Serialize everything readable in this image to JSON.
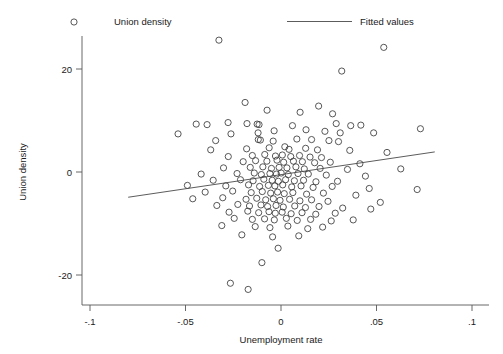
{
  "chart_data": {
    "type": "scatter",
    "title": "",
    "xlabel": "Unemployment rate",
    "ylabel": "Union density",
    "xlim": [
      -0.1,
      0.1
    ],
    "ylim": [
      -26,
      27
    ],
    "xticks": [
      -0.1,
      -0.05,
      0,
      0.05,
      0.1
    ],
    "xticklabels": [
      "-.1",
      "-.05",
      "0",
      ".05",
      ".1"
    ],
    "yticks": [
      20,
      0,
      -20
    ],
    "yticklabels": [
      "20",
      "0",
      "-20"
    ],
    "grid": false,
    "legend_position": "top",
    "legend": [
      {
        "label": "Union density",
        "marker": "open-circle"
      },
      {
        "label": "Fitted values",
        "marker": "line"
      }
    ],
    "series": [
      {
        "name": "Union density",
        "marker": "open-circle",
        "marker_color": "#3a3a3a",
        "points": [
          [
            -0.0325,
            25.6
          ],
          [
            0.0538,
            24.2
          ],
          [
            0.0318,
            19.6
          ],
          [
            -0.0188,
            13.5
          ],
          [
            -0.0073,
            12.0
          ],
          [
            0.01,
            11.6
          ],
          [
            0.0197,
            12.8
          ],
          [
            0.027,
            11.3
          ],
          [
            -0.0444,
            9.3
          ],
          [
            -0.0387,
            9.2
          ],
          [
            -0.0277,
            9.6
          ],
          [
            -0.0178,
            9.4
          ],
          [
            -0.0125,
            9.3
          ],
          [
            -0.0115,
            9.2
          ],
          [
            0.006,
            9.0
          ],
          [
            0.0289,
            9.4
          ],
          [
            0.0365,
            9.0
          ],
          [
            0.0418,
            9.1
          ],
          [
            -0.0539,
            7.4
          ],
          [
            -0.0262,
            7.4
          ],
          [
            -0.012,
            7.6
          ],
          [
            -0.0036,
            8.0
          ],
          [
            0.0131,
            8.2
          ],
          [
            0.023,
            7.9
          ],
          [
            0.031,
            7.6
          ],
          [
            0.0485,
            7.6
          ],
          [
            0.073,
            8.4
          ],
          [
            -0.0342,
            6.1
          ],
          [
            -0.0119,
            6.3
          ],
          [
            -0.0108,
            6.2
          ],
          [
            -0.0041,
            6.0
          ],
          [
            0.0083,
            6.4
          ],
          [
            0.016,
            6.3
          ],
          [
            0.0251,
            6.1
          ],
          [
            0.0301,
            5.9
          ],
          [
            -0.0368,
            4.3
          ],
          [
            -0.018,
            4.5
          ],
          [
            -0.0062,
            4.7
          ],
          [
            0.002,
            4.9
          ],
          [
            0.0042,
            4.4
          ],
          [
            0.0129,
            4.6
          ],
          [
            0.0191,
            4.3
          ],
          [
            0.036,
            4.2
          ],
          [
            0.0555,
            3.8
          ],
          [
            -0.0276,
            3.0
          ],
          [
            -0.015,
            3.2
          ],
          [
            -0.0085,
            3.4
          ],
          [
            -0.0029,
            3.1
          ],
          [
            0.0007,
            3.3
          ],
          [
            0.0051,
            3.0
          ],
          [
            0.0097,
            3.2
          ],
          [
            0.0152,
            2.9
          ],
          [
            0.0212,
            2.8
          ],
          [
            -0.0198,
            2.0
          ],
          [
            -0.0133,
            2.2
          ],
          [
            -0.0074,
            2.1
          ],
          [
            -0.0021,
            2.3
          ],
          [
            0.0014,
            1.9
          ],
          [
            0.0065,
            2.1
          ],
          [
            0.0112,
            2.0
          ],
          [
            0.0176,
            1.8
          ],
          [
            0.0258,
            1.9
          ],
          [
            0.0413,
            1.6
          ],
          [
            -0.0301,
            0.8
          ],
          [
            -0.0161,
            0.9
          ],
          [
            -0.0095,
            1.0
          ],
          [
            -0.005,
            0.7
          ],
          [
            -0.001,
            0.9
          ],
          [
            0.0031,
            0.8
          ],
          [
            0.0078,
            1.0
          ],
          [
            0.0122,
            0.6
          ],
          [
            0.0205,
            0.7
          ],
          [
            0.0348,
            0.5
          ],
          [
            0.0627,
            0.6
          ],
          [
            -0.0418,
            -0.4
          ],
          [
            -0.023,
            -0.3
          ],
          [
            -0.014,
            -0.2
          ],
          [
            -0.0103,
            -0.5
          ],
          [
            -0.0058,
            -0.3
          ],
          [
            -0.0024,
            -0.4
          ],
          [
            0.0001,
            -0.2
          ],
          [
            0.0038,
            -0.5
          ],
          [
            0.0089,
            -0.3
          ],
          [
            0.0143,
            -0.4
          ],
          [
            0.0237,
            -0.6
          ],
          [
            0.0442,
            -0.8
          ],
          [
            -0.0355,
            -1.6
          ],
          [
            -0.0212,
            -1.5
          ],
          [
            -0.0146,
            -1.7
          ],
          [
            -0.009,
            -1.4
          ],
          [
            -0.0046,
            -1.6
          ],
          [
            -0.0014,
            -1.8
          ],
          [
            0.0024,
            -1.5
          ],
          [
            0.007,
            -1.7
          ],
          [
            0.0118,
            -1.6
          ],
          [
            0.0183,
            -1.9
          ],
          [
            0.0296,
            -1.8
          ],
          [
            -0.049,
            -2.6
          ],
          [
            -0.0289,
            -2.7
          ],
          [
            -0.017,
            -2.5
          ],
          [
            -0.0112,
            -2.8
          ],
          [
            -0.0066,
            -2.6
          ],
          [
            -0.0032,
            -2.7
          ],
          [
            0.0009,
            -2.5
          ],
          [
            0.0056,
            -2.9
          ],
          [
            0.0105,
            -2.7
          ],
          [
            0.0168,
            -3.0
          ],
          [
            0.0268,
            -2.8
          ],
          [
            0.0462,
            -3.2
          ],
          [
            0.0713,
            -3.4
          ],
          [
            -0.0397,
            -3.9
          ],
          [
            -0.0253,
            -3.7
          ],
          [
            -0.0156,
            -4.0
          ],
          [
            -0.0098,
            -3.8
          ],
          [
            -0.0054,
            -4.1
          ],
          [
            -0.0018,
            -3.9
          ],
          [
            0.0017,
            -4.2
          ],
          [
            0.0062,
            -4.0
          ],
          [
            0.0134,
            -4.3
          ],
          [
            0.0222,
            -4.1
          ],
          [
            0.0392,
            -4.5
          ],
          [
            -0.0462,
            -5.2
          ],
          [
            -0.0305,
            -5.0
          ],
          [
            -0.0183,
            -5.3
          ],
          [
            -0.0127,
            -5.1
          ],
          [
            -0.008,
            -5.4
          ],
          [
            -0.004,
            -5.2
          ],
          [
            -0.0005,
            -5.5
          ],
          [
            0.0045,
            -5.3
          ],
          [
            0.0099,
            -5.6
          ],
          [
            0.016,
            -5.4
          ],
          [
            0.0246,
            -5.7
          ],
          [
            0.052,
            -5.9
          ],
          [
            -0.0336,
            -6.5
          ],
          [
            -0.0226,
            -6.3
          ],
          [
            -0.0165,
            -6.6
          ],
          [
            -0.0105,
            -6.4
          ],
          [
            -0.007,
            -6.7
          ],
          [
            -0.0026,
            -6.5
          ],
          [
            0.0012,
            -6.8
          ],
          [
            0.0072,
            -6.6
          ],
          [
            0.0128,
            -6.9
          ],
          [
            0.0199,
            -6.7
          ],
          [
            0.0323,
            -7.0
          ],
          [
            0.047,
            -7.2
          ],
          [
            -0.0272,
            -7.8
          ],
          [
            -0.0174,
            -7.6
          ],
          [
            -0.0117,
            -7.9
          ],
          [
            -0.0063,
            -7.7
          ],
          [
            -0.003,
            -8.0
          ],
          [
            0.0006,
            -7.8
          ],
          [
            0.0053,
            -8.1
          ],
          [
            0.011,
            -7.9
          ],
          [
            0.0182,
            -8.2
          ],
          [
            0.0284,
            -8.0
          ],
          [
            -0.0245,
            -9.0
          ],
          [
            -0.015,
            -9.2
          ],
          [
            -0.0086,
            -9.1
          ],
          [
            -0.0035,
            -9.3
          ],
          [
            0.0028,
            -9.0
          ],
          [
            0.0085,
            -9.4
          ],
          [
            0.0155,
            -9.2
          ],
          [
            0.0263,
            -9.5
          ],
          [
            0.0378,
            -9.3
          ],
          [
            -0.031,
            -10.4
          ],
          [
            -0.0135,
            -10.6
          ],
          [
            -0.0058,
            -10.8
          ],
          [
            0.0036,
            -10.5
          ],
          [
            0.014,
            -11.0
          ],
          [
            0.0218,
            -10.7
          ],
          [
            -0.0205,
            -12.2
          ],
          [
            -0.0044,
            -12.6
          ],
          [
            0.0093,
            -12.4
          ],
          [
            -0.0015,
            -14.8
          ],
          [
            -0.01,
            -17.6
          ],
          [
            -0.0265,
            -21.6
          ],
          [
            -0.0172,
            -22.8
          ]
        ]
      }
    ],
    "fit_line": {
      "name": "Fitted values",
      "color": "#4a4a4a",
      "x0": -0.08,
      "y0": -4.9,
      "x1": 0.0805,
      "y1": 3.9
    }
  }
}
